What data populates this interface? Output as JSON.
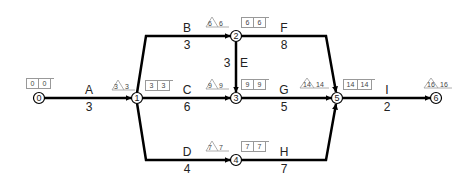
{
  "diagram": {
    "type": "activity-on-arrow network",
    "nodes": [
      {
        "id": "0",
        "x": 39,
        "y": 98,
        "label": "0"
      },
      {
        "id": "1",
        "x": 137,
        "y": 98,
        "label": "1"
      },
      {
        "id": "2",
        "x": 236,
        "y": 36,
        "label": "2"
      },
      {
        "id": "3",
        "x": 236,
        "y": 98,
        "label": "3"
      },
      {
        "id": "4",
        "x": 236,
        "y": 160,
        "label": "4"
      },
      {
        "id": "5",
        "x": 337,
        "y": 98,
        "label": "5"
      },
      {
        "id": "6",
        "x": 436,
        "y": 98,
        "label": "6"
      }
    ],
    "activities": [
      {
        "name": "A",
        "duration": "3",
        "from": "0",
        "to": "1"
      },
      {
        "name": "B",
        "duration": "3",
        "from": "1",
        "to": "2"
      },
      {
        "name": "C",
        "duration": "6",
        "from": "1",
        "to": "3"
      },
      {
        "name": "D",
        "duration": "4",
        "from": "1",
        "to": "4"
      },
      {
        "name": "E",
        "duration": "3",
        "from": "2",
        "to": "3"
      },
      {
        "name": "F",
        "duration": "8",
        "from": "2",
        "to": "5"
      },
      {
        "name": "G",
        "duration": "5",
        "from": "3",
        "to": "5"
      },
      {
        "name": "H",
        "duration": "7",
        "from": "4",
        "to": "5"
      },
      {
        "name": "I",
        "duration": "2",
        "from": "5",
        "to": "6"
      }
    ],
    "node_times": [
      {
        "node": "0",
        "box": [
          "0",
          "0"
        ]
      },
      {
        "node": "1",
        "triangle": [
          "3",
          "3"
        ],
        "box": [
          "3",
          "3"
        ]
      },
      {
        "node": "2",
        "triangle": [
          "6",
          "6"
        ],
        "box": [
          "6",
          "6"
        ]
      },
      {
        "node": "3",
        "triangle": [
          "9",
          "9"
        ],
        "box": [
          "9",
          "9"
        ]
      },
      {
        "node": "4",
        "triangle": [
          "7",
          "7"
        ],
        "box": [
          "7",
          "7"
        ]
      },
      {
        "node": "5",
        "triangle": [
          "14",
          "14"
        ],
        "box": [
          "14",
          "14"
        ]
      },
      {
        "node": "6",
        "triangle": [
          "16",
          "16"
        ]
      }
    ]
  }
}
